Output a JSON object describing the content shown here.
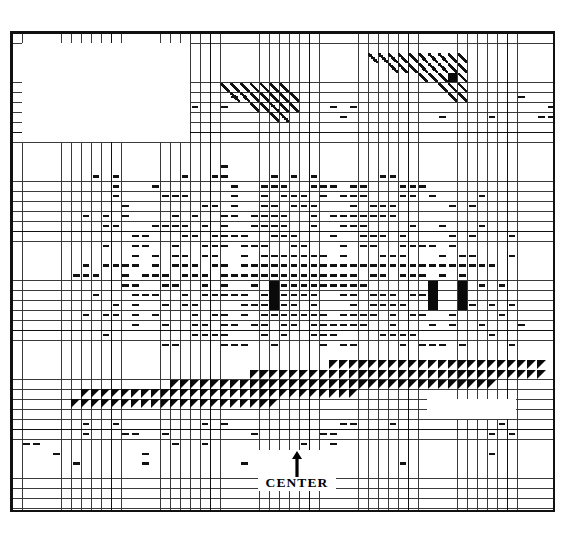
{
  "document": {
    "kind": "cross-stitch-pattern-chart",
    "title": "",
    "background_color": "#ffffff",
    "ink_color": "#111111"
  },
  "chart": {
    "grid": {
      "columns": 55,
      "rows": 48,
      "cell_size_px": 9.9,
      "heavy_line_every": 10,
      "fine_line_color": "#3a3a3a",
      "heavy_line_color": "#111111",
      "border_color": "#111111",
      "left_px": 10,
      "top_px": 31,
      "width_px": 545,
      "height_px": 481
    },
    "legend_symbols": [
      {
        "key": "dash",
        "name": "dash-stitch-symbol",
        "color": "#111111"
      },
      {
        "key": "solid",
        "name": "solid-fill-symbol",
        "color": "#0a0a0a"
      },
      {
        "key": "tri",
        "name": "triangle-fill-symbol",
        "color": "#0a0a0a"
      },
      {
        "key": "slash",
        "name": "diagonal-slash-symbol",
        "color": "#111111"
      }
    ]
  },
  "center_marker": {
    "label": "CENTER",
    "arrow": "up-arrow",
    "arrow_direction": "up"
  },
  "chart_data": {
    "type": "heatmap",
    "title": "",
    "xlabel": "",
    "ylabel": "",
    "grid": true,
    "legend_position": "none",
    "categories": [],
    "values": [],
    "blank_regions": [
      {
        "name": "top-left-blank",
        "col": 1,
        "row": 1,
        "cols": 17,
        "rows": 10
      },
      {
        "name": "bottom-right-blank",
        "col": 42,
        "row": 37,
        "cols": 9,
        "rows": 2
      }
    ],
    "symbol_cells": {
      "slash": [
        [
          21,
          5
        ],
        [
          22,
          5
        ],
        [
          23,
          5
        ],
        [
          24,
          5
        ],
        [
          25,
          5
        ],
        [
          26,
          5
        ],
        [
          27,
          5
        ],
        [
          22,
          6
        ],
        [
          23,
          6
        ],
        [
          24,
          6
        ],
        [
          25,
          6
        ],
        [
          26,
          6
        ],
        [
          27,
          6
        ],
        [
          28,
          6
        ],
        [
          24,
          7
        ],
        [
          25,
          7
        ],
        [
          26,
          7
        ],
        [
          27,
          7
        ],
        [
          28,
          7
        ],
        [
          26,
          8
        ],
        [
          27,
          8
        ],
        [
          36,
          2
        ],
        [
          37,
          2
        ],
        [
          38,
          2
        ],
        [
          39,
          2
        ],
        [
          40,
          2
        ],
        [
          41,
          2
        ],
        [
          42,
          2
        ],
        [
          43,
          2
        ],
        [
          44,
          2
        ],
        [
          45,
          2
        ],
        [
          38,
          3
        ],
        [
          39,
          3
        ],
        [
          40,
          3
        ],
        [
          41,
          3
        ],
        [
          42,
          3
        ],
        [
          43,
          3
        ],
        [
          44,
          3
        ],
        [
          45,
          3
        ],
        [
          41,
          4
        ],
        [
          42,
          4
        ],
        [
          43,
          4
        ],
        [
          44,
          4
        ],
        [
          45,
          4
        ],
        [
          43,
          5
        ],
        [
          44,
          5
        ],
        [
          45,
          5
        ],
        [
          44,
          6
        ],
        [
          45,
          6
        ]
      ],
      "solid": [
        [
          26,
          25
        ],
        [
          26,
          26
        ],
        [
          26,
          27
        ],
        [
          42,
          25
        ],
        [
          42,
          26
        ],
        [
          42,
          27
        ],
        [
          45,
          25
        ],
        [
          45,
          26
        ],
        [
          45,
          27
        ],
        [
          44,
          4
        ]
      ],
      "tri_wedge_rows": [
        {
          "row": 33,
          "start_col": 32,
          "end_col": 53
        },
        {
          "row": 34,
          "start_col": 24,
          "end_col": 53
        },
        {
          "row": 35,
          "start_col": 16,
          "end_col": 48
        },
        {
          "row": 36,
          "start_col": 7,
          "end_col": 34
        },
        {
          "row": 37,
          "start_col": 6,
          "end_col": 26
        }
      ],
      "dash_density": "dense field spanning columns 4-53, rows 9-40, thinning toward the lower and outer edges"
    }
  }
}
